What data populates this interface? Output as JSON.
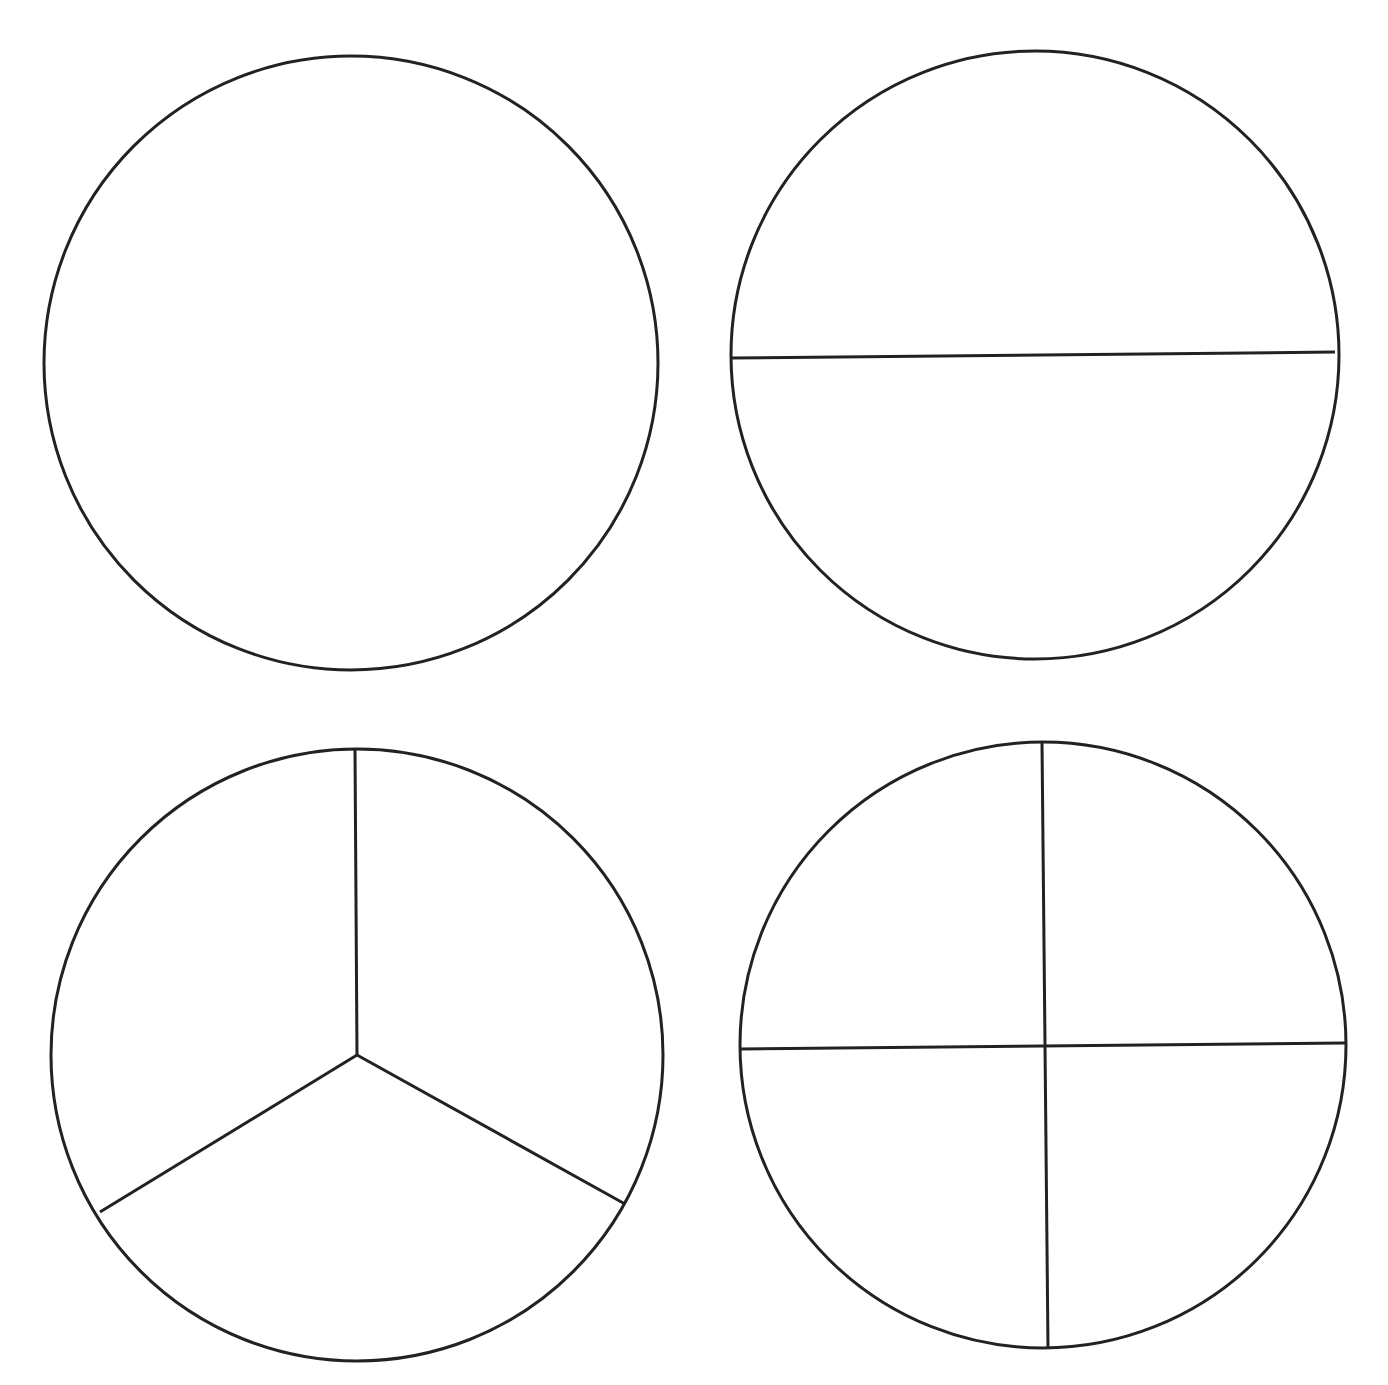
{
  "colors": {
    "background": "#ffffff",
    "stroke": "#222222"
  },
  "stroke_width": 3,
  "circles": [
    {
      "name": "whole",
      "parts": 1,
      "cx": 351,
      "cy": 363,
      "r": 307
    },
    {
      "name": "halves",
      "parts": 2,
      "cx": 1035,
      "cy": 355,
      "r": 304
    },
    {
      "name": "thirds",
      "parts": 3,
      "cx": 357,
      "cy": 1055,
      "r": 306
    },
    {
      "name": "quarters",
      "parts": 4,
      "cx": 1043,
      "cy": 1045,
      "r": 303
    }
  ]
}
